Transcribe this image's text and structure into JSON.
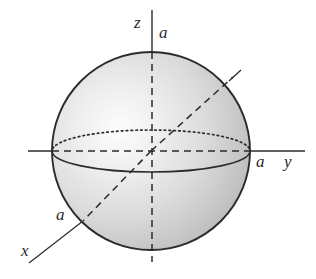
{
  "figure": {
    "background_color": "#ffffff",
    "ink_color": "#2b2b2b",
    "sphere": {
      "center": {
        "x": 151,
        "y": 151
      },
      "radius": 99,
      "fill_light": "#fdfdfd",
      "fill_mid": "#d8d8d8",
      "fill_dark": "#b4b4b4",
      "outline_color": "#2b2b2b",
      "highlight": {
        "x": 118,
        "y": 138
      }
    },
    "equator": {
      "semi_axis_x": 99,
      "semi_axis_y": 21,
      "back_half_style": "dotted",
      "front_half_style": "solid"
    }
  },
  "axes": [
    {
      "name": "z-axis",
      "label": "z",
      "tick_label": "a",
      "direction": "up",
      "solid_from": {
        "x": 152,
        "y": 10
      },
      "solid_to": {
        "x": 152,
        "y": 52
      },
      "dashed_from": {
        "x": 152,
        "y": 52
      },
      "dashed_to": {
        "x": 152,
        "y": 262
      }
    },
    {
      "name": "y-axis",
      "label": "y",
      "tick_label": "a",
      "direction": "right",
      "solid_from": {
        "x": 28,
        "y": 151
      },
      "solid_to": {
        "x": 305,
        "y": 151
      },
      "dashed_from": {
        "x": 52,
        "y": 151
      },
      "dashed_to": {
        "x": 250,
        "y": 151
      }
    },
    {
      "name": "x-axis",
      "label": "x",
      "tick_label": "a",
      "direction": "down-left",
      "solid_from": {
        "x": 29,
        "y": 263
      },
      "solid_to": {
        "x": 83,
        "y": 221
      },
      "dashed_from": {
        "x": 83,
        "y": 221
      },
      "dashed_to": {
        "x": 151,
        "y": 151
      }
    },
    {
      "name": "radius-ray-upper-right",
      "label": "",
      "tick_label": "",
      "direction": "up-right",
      "dashed_from": {
        "x": 151,
        "y": 151
      },
      "dashed_to": {
        "x": 233,
        "y": 77
      },
      "solid_from": {
        "x": 231,
        "y": 79
      },
      "solid_to": {
        "x": 241,
        "y": 70
      }
    }
  ],
  "labels": {
    "z": "z",
    "a_on_z": "a",
    "a_on_y": "a",
    "y": "y",
    "a_on_x": "a",
    "x": "x"
  }
}
